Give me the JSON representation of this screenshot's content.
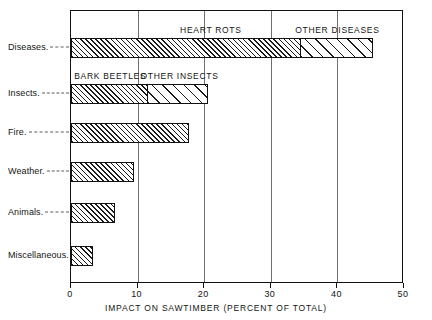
{
  "chart_data": {
    "type": "bar",
    "orientation": "horizontal",
    "title": "",
    "xlabel": "IMPACT ON SAWTIMBER (PERCENT OF TOTAL)",
    "ylabel": "",
    "xlim": [
      0,
      50
    ],
    "ylim": null,
    "grid": true,
    "legend_position": "inline-annotations",
    "xticks": [
      0,
      10,
      20,
      30,
      40,
      50
    ],
    "xtick_labels": [
      "0",
      "10",
      "20",
      "30",
      "40",
      "50"
    ],
    "categories": [
      "Diseases",
      "Insects",
      "Fire",
      "Weather",
      "Animals",
      "Miscellaneous"
    ],
    "values": [
      45.3,
      20.6,
      17.7,
      9.4,
      6.6,
      3.3
    ],
    "stacked": true,
    "bars": [
      {
        "category": "Diseases",
        "total": 45.3,
        "segments": [
          {
            "label": "HEART ROTS",
            "value": 34.5,
            "start": 0,
            "end": 34.5,
            "fill": "hatch-dense"
          },
          {
            "label": "OTHER DISEASES",
            "value": 10.8,
            "start": 34.5,
            "end": 45.3,
            "fill": "hatch-sparse"
          }
        ]
      },
      {
        "category": "Insects",
        "total": 20.6,
        "segments": [
          {
            "label": "BARK BEETLES",
            "value": 11.5,
            "start": 0,
            "end": 11.5,
            "fill": "hatch-dense"
          },
          {
            "label": "OTHER INSECTS",
            "value": 9.1,
            "start": 11.5,
            "end": 20.6,
            "fill": "hatch-sparse"
          }
        ]
      },
      {
        "category": "Fire",
        "total": 17.7,
        "segments": [
          {
            "label": "",
            "value": 17.7,
            "start": 0,
            "end": 17.7,
            "fill": "hatch-dense"
          }
        ]
      },
      {
        "category": "Weather",
        "total": 9.4,
        "segments": [
          {
            "label": "",
            "value": 9.4,
            "start": 0,
            "end": 9.4,
            "fill": "hatch-dense"
          }
        ]
      },
      {
        "category": "Animals",
        "total": 6.6,
        "segments": [
          {
            "label": "",
            "value": 6.6,
            "start": 0,
            "end": 6.6,
            "fill": "hatch-dense"
          }
        ]
      },
      {
        "category": "Miscellaneous",
        "total": 3.3,
        "segments": [
          {
            "label": "",
            "value": 3.3,
            "start": 0,
            "end": 3.3,
            "fill": "hatch-dense"
          }
        ]
      }
    ],
    "annotations": [
      {
        "text": "HEART ROTS",
        "at_value": 21.0,
        "row": "Diseases"
      },
      {
        "text": "OTHER DISEASES",
        "at_value": 40.0,
        "row": "Diseases"
      },
      {
        "text": "BARK BEETLES",
        "at_value": 5.9,
        "row": "Insects"
      },
      {
        "text": "OTHER INSECTS",
        "at_value": 16.3,
        "row": "Insects"
      }
    ],
    "category_labels": [
      "Diseases.",
      "Insects.",
      "Fire.",
      "Weather.",
      "Animals.",
      "Miscellaneous."
    ],
    "colors": {
      "axis": "#111111",
      "grid": "#6f6f6f",
      "hatch": "#1a1a1a",
      "background": "#ffffff",
      "text": "#141414"
    }
  }
}
